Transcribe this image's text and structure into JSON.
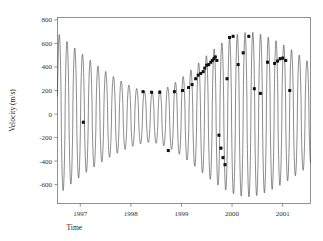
{
  "figure": {
    "background_color": "#ffffff",
    "frame_color": "#777777",
    "curve_color": "#2b2b2b",
    "point_color": "#111111"
  },
  "chart_data": {
    "type": "line",
    "title": "",
    "subtitle": "",
    "xlabel": "Time",
    "ylabel": "Velocity (m/s)",
    "xlim": [
      1996.55,
      2001.55
    ],
    "ylim": [
      -760,
      820
    ],
    "grid": false,
    "legend": null,
    "x_tick_labels": [
      "1997",
      "1998",
      "1999",
      "2000",
      "2001"
    ],
    "x_tick_values": [
      1997,
      1998,
      1999,
      2000,
      2001
    ],
    "y_tick_labels": [
      "800",
      "600",
      "400",
      "200",
      "0",
      "-200",
      "-400",
      "-600"
    ],
    "y_tick_values": [
      800,
      600,
      400,
      200,
      0,
      -200,
      -400,
      -600
    ],
    "series": [
      {
        "name": "Keplerian model",
        "type": "line",
        "description": "High-frequency radial velocity oscillation with slowly modulated amplitude envelope",
        "model": {
          "period_years": 0.153,
          "phase_offset": 0.02,
          "envelope_center_amplitude": 190,
          "envelope_min_year": 1998.35,
          "envelope_min_amplitude": 215,
          "envelope_start_amplitude": 690,
          "envelope_end_amplitude": 700,
          "envelope_trough_offset": -60,
          "envelope_peak_year": 2000.35
        }
      },
      {
        "name": "Observed radial velocities",
        "type": "scatter_errorbar",
        "marker": "filled-square",
        "x": [
          1997.06,
          1998.24,
          1998.41,
          1998.57,
          1998.74,
          1998.86,
          1999.02,
          1999.14,
          1999.21,
          1999.28,
          1999.33,
          1999.38,
          1999.43,
          1999.46,
          1999.5,
          1999.54,
          1999.58,
          1999.61,
          1999.64,
          1999.67,
          1999.7,
          1999.74,
          1999.78,
          1999.82,
          1999.86,
          1999.9,
          1999.95,
          2000.02,
          2000.12,
          2000.22,
          2000.33,
          2000.44,
          2000.56,
          2000.7,
          2000.84,
          2000.9,
          2000.95,
          2001.0,
          2001.06,
          2001.14
        ],
        "y": [
          -70,
          190,
          185,
          185,
          -310,
          190,
          200,
          225,
          250,
          300,
          330,
          345,
          360,
          390,
          415,
          420,
          440,
          455,
          470,
          485,
          455,
          -180,
          -290,
          -370,
          -430,
          300,
          650,
          660,
          420,
          520,
          660,
          215,
          175,
          440,
          430,
          450,
          470,
          475,
          455,
          200
        ],
        "yerr": [
          14,
          12,
          12,
          12,
          14,
          12,
          12,
          12,
          12,
          12,
          12,
          12,
          12,
          12,
          12,
          12,
          12,
          12,
          12,
          12,
          12,
          14,
          14,
          14,
          14,
          13,
          13,
          13,
          13,
          13,
          13,
          13,
          13,
          13,
          13,
          13,
          13,
          13,
          13,
          13
        ]
      }
    ]
  }
}
